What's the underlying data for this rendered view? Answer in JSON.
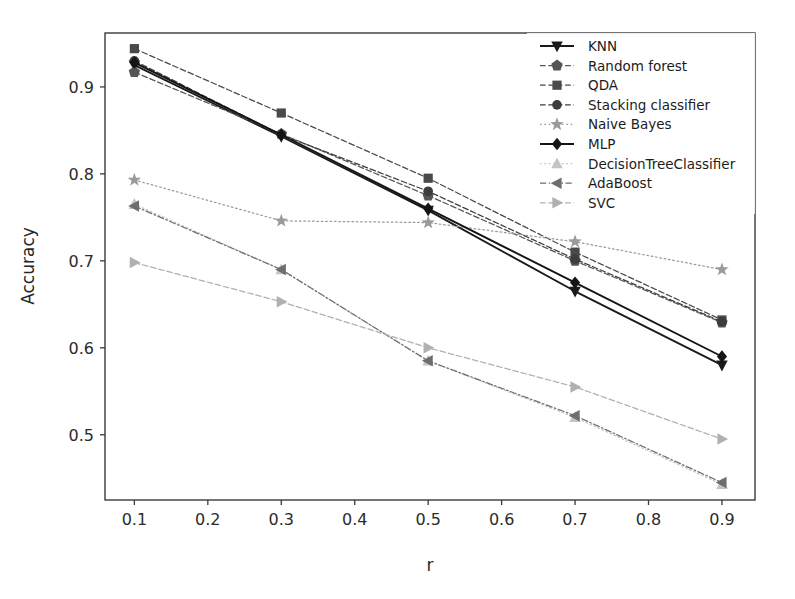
{
  "chart_data": {
    "type": "line",
    "title": "",
    "xlabel": "r",
    "ylabel": "Accuracy",
    "x": [
      0.1,
      0.3,
      0.5,
      0.7,
      0.9
    ],
    "xtick_labels": [
      "0.1",
      "0.2",
      "0.3",
      "0.4",
      "0.5",
      "0.6",
      "0.7",
      "0.8",
      "0.9"
    ],
    "xticks": [
      0.1,
      0.2,
      0.3,
      0.4,
      0.5,
      0.6,
      0.7,
      0.8,
      0.9
    ],
    "ytick_labels": [
      "0.5",
      "0.6",
      "0.7",
      "0.8",
      "0.9"
    ],
    "yticks": [
      0.5,
      0.6,
      0.7,
      0.8,
      0.9
    ],
    "xlim": [
      0.06,
      0.945
    ],
    "ylim": [
      0.425,
      0.962
    ],
    "grid": false,
    "legend_position": "upper right",
    "series": [
      {
        "name": "KNN",
        "marker": "triangle-down",
        "color": "#1a1a1a",
        "linestyle": "solid",
        "values": [
          0.925,
          0.843,
          0.758,
          0.665,
          0.58
        ]
      },
      {
        "name": "Random forest",
        "marker": "pentagon",
        "color": "#555555",
        "linestyle": "dashed",
        "values": [
          0.917,
          0.846,
          0.775,
          0.7,
          0.629
        ]
      },
      {
        "name": "QDA",
        "marker": "square",
        "color": "#4a4a4a",
        "linestyle": "dashed",
        "values": [
          0.944,
          0.87,
          0.795,
          0.71,
          0.632
        ]
      },
      {
        "name": "Stacking classifier",
        "marker": "circle",
        "color": "#3d3d3d",
        "linestyle": "dashed",
        "values": [
          0.93,
          0.845,
          0.78,
          0.702,
          0.63
        ]
      },
      {
        "name": "Naive Bayes",
        "marker": "star",
        "color": "#9a9a9a",
        "linestyle": "dotted",
        "values": [
          0.793,
          0.746,
          0.744,
          0.722,
          0.69
        ]
      },
      {
        "name": "MLP",
        "marker": "diamond",
        "color": "#141414",
        "linestyle": "solid",
        "values": [
          0.928,
          0.845,
          0.76,
          0.675,
          0.59
        ]
      },
      {
        "name": "DecisionTreeClassifier",
        "marker": "triangle-up",
        "color": "#c4c4c4",
        "linestyle": "dotted",
        "values": [
          0.765,
          0.69,
          0.585,
          0.52,
          0.443
        ]
      },
      {
        "name": "AdaBoost",
        "marker": "triangle-left",
        "color": "#6e6e6e",
        "linestyle": "dashdot",
        "values": [
          0.763,
          0.69,
          0.585,
          0.522,
          0.445
        ]
      },
      {
        "name": "SVC",
        "marker": "triangle-right",
        "color": "#b0b0b0",
        "linestyle": "dashed",
        "values": [
          0.698,
          0.653,
          0.6,
          0.555,
          0.495
        ]
      }
    ]
  },
  "legend": {
    "entries": [
      "KNN",
      "Random forest",
      "QDA",
      "Stacking classifier",
      "Naive Bayes",
      "MLP",
      "DecisionTreeClassifier",
      "AdaBoost",
      "SVC"
    ]
  },
  "axes": {
    "x_label": "r",
    "y_label": "Accuracy"
  },
  "colors": {
    "axis": "#3a3a3a",
    "background": "#ffffff",
    "text": "#262626"
  }
}
